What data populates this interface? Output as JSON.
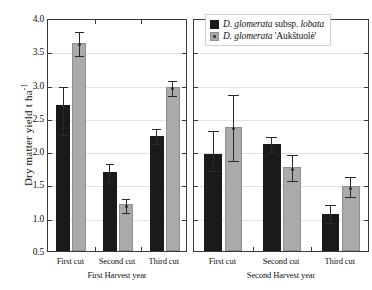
{
  "chart_data": {
    "type": "bar",
    "title": "",
    "xlabel": "",
    "ylabel": "Dry matter yield  t ha",
    "ylabel_superscript": "-1",
    "ylim": [
      0.5,
      4.0
    ],
    "ytick_labels": [
      "4.0",
      "3.5",
      "3.0",
      "2.5",
      "2.0",
      "1.5",
      "1.0",
      "0.5"
    ],
    "ytick_values": [
      4.0,
      3.5,
      3.0,
      2.5,
      2.0,
      1.5,
      1.0,
      0.5
    ],
    "grid": true,
    "legend_position": "top-right",
    "categories": [
      "First cut",
      "Second cut",
      "Third cut"
    ],
    "panels": [
      {
        "name": "First Harvest year",
        "categories": [
          "First cut",
          "Second cut",
          "Third cut"
        ],
        "series": [
          {
            "name": "D. glomerata subsp. lobata",
            "color": "#1a1a1a",
            "values": [
              2.7,
              1.68,
              2.23
            ],
            "err_low": [
              2.25,
              1.55,
              2.12
            ],
            "err_high": [
              3.0,
              1.83,
              2.36
            ]
          },
          {
            "name": "D. glomerata 'Aukštuolė'",
            "color": "#aaaaaa",
            "values": [
              3.63,
              1.2,
              2.97
            ],
            "err_low": [
              3.45,
              1.09,
              2.85
            ],
            "err_high": [
              3.82,
              1.31,
              3.09
            ]
          }
        ]
      },
      {
        "name": "Second Harvest year",
        "categories": [
          "First cut",
          "Second cut",
          "Third cut"
        ],
        "series": [
          {
            "name": "D. glomerata subsp. lobata",
            "color": "#1a1a1a",
            "values": [
              1.95,
              2.11,
              1.05
            ],
            "err_low": [
              1.72,
              1.99,
              0.93
            ],
            "err_high": [
              2.33,
              2.24,
              1.22
            ]
          },
          {
            "name": "D. glomerata 'Aukštuolė'",
            "color": "#aaaaaa",
            "values": [
              2.37,
              1.76,
              1.47
            ],
            "err_low": [
              1.87,
              1.57,
              1.32
            ],
            "err_high": [
              2.88,
              1.97,
              1.64
            ]
          }
        ]
      }
    ]
  },
  "legend": {
    "items": [
      {
        "swatch": "black",
        "prefix": "D. glomerata",
        "mid": " subsp. ",
        "suffix": "lobata",
        "full": "D. glomerata subsp. lobata"
      },
      {
        "swatch": "grey",
        "prefix": "D. glomerata",
        "mid": " ",
        "suffix": "'Aukštuolė'",
        "full": "D. glomerata 'Aukštuolė'"
      }
    ]
  },
  "axis": {
    "y_title_main": "Dry matter yield  t ha",
    "y_title_sup": "-1"
  }
}
